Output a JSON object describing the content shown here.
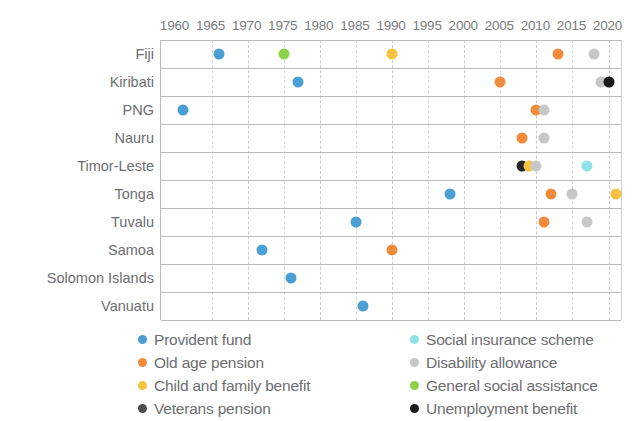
{
  "chart_data": {
    "type": "scatter",
    "title": "",
    "xlabel": "",
    "ylabel": "",
    "xlim": [
      1958,
      2022
    ],
    "grid": true,
    "legend_position": "bottom",
    "xticks": [
      1960,
      1965,
      1970,
      1975,
      1980,
      1985,
      1990,
      1995,
      2000,
      2005,
      2010,
      2015,
      2020
    ],
    "categories": [
      "Fiji",
      "Kiribati",
      "PNG",
      "Nauru",
      "Timor-Leste",
      "Tonga",
      "Tuvalu",
      "Samoa",
      "Solomon Islands",
      "Vanuatu"
    ],
    "series": [
      {
        "name": "Provident fund",
        "color": "#4a9fd5",
        "key": "provident_fund"
      },
      {
        "name": "Old age pension",
        "color": "#f28b3c",
        "key": "old_age_pension"
      },
      {
        "name": "Child and family  benefit",
        "color": "#f9c341",
        "key": "child_family_benefit"
      },
      {
        "name": "Veterans pension",
        "color": "#4d4d4d",
        "key": "veterans_pension"
      },
      {
        "name": "Social insurance scheme",
        "color": "#8fe2e8",
        "key": "social_insurance_scheme"
      },
      {
        "name": "Disability allowance",
        "color": "#c6c7c9",
        "key": "disability_allowance"
      },
      {
        "name": "General social assistance",
        "color": "#8ed14a",
        "key": "general_social_assistance"
      },
      {
        "name": "Unemployment benefit",
        "color": "#1a1a1a",
        "key": "unemployment_benefit"
      }
    ],
    "points": [
      {
        "country": "Fiji",
        "year": 1966,
        "series": "Provident fund",
        "color": "#4a9fd5"
      },
      {
        "country": "Fiji",
        "year": 1975,
        "series": "General social assistance",
        "color": "#8ed14a"
      },
      {
        "country": "Fiji",
        "year": 1990,
        "series": "Child and family  benefit",
        "color": "#f9c341"
      },
      {
        "country": "Fiji",
        "year": 2013,
        "series": "Old age pension",
        "color": "#f28b3c"
      },
      {
        "country": "Fiji",
        "year": 2018,
        "series": "Disability allowance",
        "color": "#c6c7c9"
      },
      {
        "country": "Kiribati",
        "year": 1977,
        "series": "Provident fund",
        "color": "#4a9fd5"
      },
      {
        "country": "Kiribati",
        "year": 2005,
        "series": "Old age pension",
        "color": "#f28b3c"
      },
      {
        "country": "Kiribati",
        "year": 2019,
        "series": "Disability allowance",
        "color": "#c6c7c9"
      },
      {
        "country": "Kiribati",
        "year": 2020,
        "series": "Unemployment benefit",
        "color": "#1a1a1a"
      },
      {
        "country": "PNG",
        "year": 1961,
        "series": "Provident fund",
        "color": "#4a9fd5"
      },
      {
        "country": "PNG",
        "year": 2010,
        "series": "Old age pension",
        "color": "#f28b3c"
      },
      {
        "country": "PNG",
        "year": 2011,
        "series": "Disability allowance",
        "color": "#c6c7c9"
      },
      {
        "country": "Nauru",
        "year": 2008,
        "series": "Old age pension",
        "color": "#f28b3c"
      },
      {
        "country": "Nauru",
        "year": 2011,
        "series": "Disability allowance",
        "color": "#c6c7c9"
      },
      {
        "country": "Timor-Leste",
        "year": 2008,
        "series": "Veterans pension",
        "color": "#262626"
      },
      {
        "country": "Timor-Leste",
        "year": 2009,
        "series": "Child and family  benefit",
        "color": "#f9c341"
      },
      {
        "country": "Timor-Leste",
        "year": 2010,
        "series": "Disability allowance",
        "color": "#c6c7c9"
      },
      {
        "country": "Timor-Leste",
        "year": 2017,
        "series": "Social insurance scheme",
        "color": "#8fe2e8"
      },
      {
        "country": "Tonga",
        "year": 1998,
        "series": "Provident fund",
        "color": "#4a9fd5"
      },
      {
        "country": "Tonga",
        "year": 2012,
        "series": "Old age pension",
        "color": "#f28b3c"
      },
      {
        "country": "Tonga",
        "year": 2015,
        "series": "Disability allowance",
        "color": "#c6c7c9"
      },
      {
        "country": "Tonga",
        "year": 2021,
        "series": "Child and family  benefit",
        "color": "#f9c341"
      },
      {
        "country": "Tuvalu",
        "year": 1985,
        "series": "Provident fund",
        "color": "#4a9fd5"
      },
      {
        "country": "Tuvalu",
        "year": 2011,
        "series": "Old age pension",
        "color": "#f28b3c"
      },
      {
        "country": "Tuvalu",
        "year": 2017,
        "series": "Disability allowance",
        "color": "#c6c7c9"
      },
      {
        "country": "Samoa",
        "year": 1972,
        "series": "Provident fund",
        "color": "#4a9fd5"
      },
      {
        "country": "Samoa",
        "year": 1990,
        "series": "Old age pension",
        "color": "#f28b3c"
      },
      {
        "country": "Solomon Islands",
        "year": 1976,
        "series": "Provident fund",
        "color": "#4a9fd5"
      },
      {
        "country": "Vanuatu",
        "year": 1986,
        "series": "Provident fund",
        "color": "#4a9fd5"
      }
    ]
  },
  "legend": {
    "left_column": [
      {
        "label": "Provident fund",
        "color": "#4a9fd5"
      },
      {
        "label": "Old age pension",
        "color": "#f28b3c"
      },
      {
        "label": "Child and family  benefit",
        "color": "#f9c341"
      },
      {
        "label": "Veterans pension",
        "color": "#4d4d4d"
      }
    ],
    "right_column": [
      {
        "label": "Social insurance scheme",
        "color": "#8fe2e8"
      },
      {
        "label": "Disability allowance",
        "color": "#c6c7c9"
      },
      {
        "label": "General social assistance",
        "color": "#8ed14a"
      },
      {
        "label": "Unemployment benefit",
        "color": "#1a1a1a"
      }
    ]
  }
}
